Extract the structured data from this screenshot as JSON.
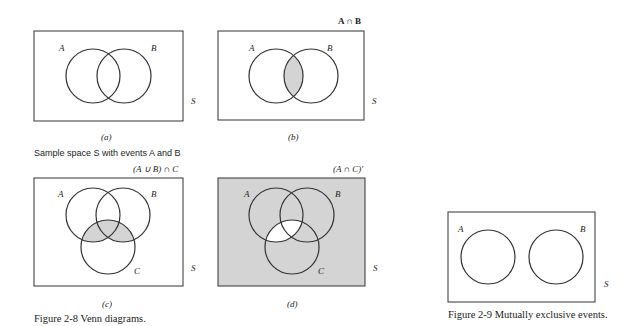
{
  "figure_2_8": {
    "caption": "Figure 2-8    Venn diagrams.",
    "subcaption_a": "Sample space S with events A and B",
    "panels": [
      {
        "id": "a",
        "label": "(a)",
        "title": "",
        "sets": [
          "A",
          "B"
        ],
        "space": "S",
        "shaded": "none"
      },
      {
        "id": "b",
        "label": "(b)",
        "title": "A ∩ B",
        "sets": [
          "A",
          "B"
        ],
        "space": "S",
        "shaded": "A ∩ B"
      },
      {
        "id": "c",
        "label": "(c)",
        "title": "(A ∪ B) ∩ C",
        "sets": [
          "A",
          "B",
          "C"
        ],
        "space": "S",
        "shaded": "(A ∪ B) ∩ C"
      },
      {
        "id": "d",
        "label": "(d)",
        "title": "(A ∩ C)'",
        "sets": [
          "A",
          "B",
          "C"
        ],
        "space": "S",
        "shaded": "(A ∩ C)'"
      }
    ]
  },
  "figure_2_9": {
    "caption": "Figure 2-9    Mutually exclusive events.",
    "sets": [
      "A",
      "B"
    ],
    "space": "S"
  },
  "colors": {
    "shade": "#d4d4d4",
    "line": "#333333",
    "background": "#ffffff"
  }
}
